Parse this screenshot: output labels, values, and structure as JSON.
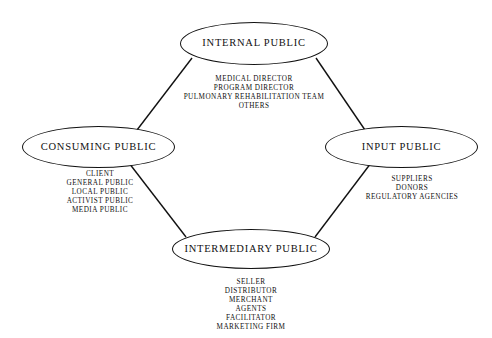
{
  "diagram": {
    "stroke_color": "#111111",
    "background_color": "#ffffff",
    "nodes": [
      {
        "id": "internal",
        "label": "INTERNAL PUBLIC",
        "position": "top",
        "items": [
          "MEDICAL DIRECTOR",
          "PROGRAM DIRECTOR",
          "PULMONARY REHABILITATION TEAM",
          "OTHERS"
        ]
      },
      {
        "id": "consuming",
        "label": "CONSUMING PUBLIC",
        "position": "left",
        "items": [
          "CLIENT",
          "GENERAL PUBLIC",
          "LOCAL PUBLIC",
          "ACTIVIST PUBLIC",
          "MEDIA PUBLIC"
        ]
      },
      {
        "id": "input",
        "label": "INPUT PUBLIC",
        "position": "right",
        "items": [
          "SUPPLIERS",
          "DONORS",
          "REGULATORY AGENCIES"
        ]
      },
      {
        "id": "intermediary",
        "label": "INTERMEDIARY PUBLIC",
        "position": "bottom",
        "items": [
          "SELLER",
          "DISTRIBUTOR",
          "MERCHANT",
          "AGENTS",
          "FACILITATOR",
          "MARKETING FIRM"
        ]
      }
    ],
    "edges": [
      {
        "id": "internal-consuming",
        "from": "internal",
        "to": "consuming"
      },
      {
        "id": "internal-input",
        "from": "internal",
        "to": "input"
      },
      {
        "id": "consuming-intermediary",
        "from": "consuming",
        "to": "intermediary"
      },
      {
        "id": "input-intermediary",
        "from": "input",
        "to": "intermediary"
      }
    ]
  }
}
